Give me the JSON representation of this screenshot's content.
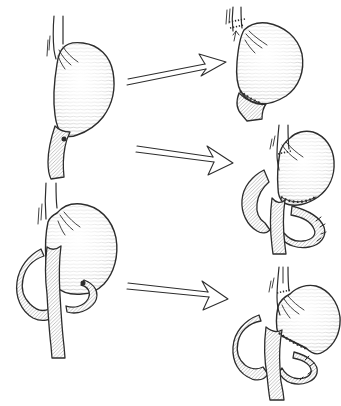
{
  "meta": {
    "description": "Hand-drawn surgical diagram: two pre-operative stomachs with dark ulcer dots on the left, arrows pointing to three post-operative stomach reconstructions with stitched anastomoses and bowel loops on the right"
  },
  "canvas": {
    "width": 341,
    "height": 406,
    "background": "#ffffff",
    "ink": "#2d2d2d",
    "hatch": "#979797"
  },
  "figures": [
    {
      "label": "pre-operative stomach with esophagus, duodenum and dark ulcer dot at the pylorus (top left)"
    },
    {
      "label": "post-operative resected stomach joined directly to the duodenum with a stitched anastomosis (top right)"
    },
    {
      "label": "post-operative resected stomach joined to a loop of bowel with stitch marks (middle right)"
    },
    {
      "label": "pre-operative stomach with duodenal bowel loop and dark ulcer dot (bottom left)"
    },
    {
      "label": "post-operative resected stomach with bowel-loop reconstruction and stitch marks (bottom right)"
    }
  ],
  "arrows": [
    {
      "label": "upper hand-drawn double-line arrow pointing right",
      "direction": "right"
    },
    {
      "label": "middle hand-drawn double-line arrow pointing right",
      "direction": "right"
    },
    {
      "label": "lower hand-drawn double-line arrow pointing right",
      "direction": "right"
    }
  ]
}
